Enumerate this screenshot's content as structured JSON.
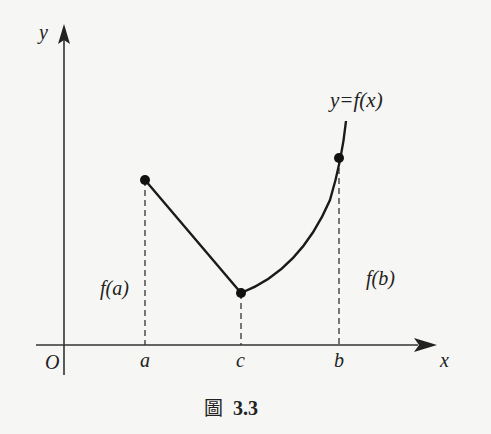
{
  "figure": {
    "caption_prefix": "圖",
    "caption_number": "3.3"
  },
  "axes": {
    "x_label": "x",
    "y_label": "y",
    "origin_label": "O"
  },
  "ticks": {
    "a": "a",
    "c": "c",
    "b": "b"
  },
  "labels": {
    "function": "y=f(x)",
    "f_a": "f(a)",
    "f_b": "f(b)"
  },
  "colors": {
    "ink": "#222222",
    "background": "#f6f6f4"
  },
  "points": [
    {
      "name": "A",
      "x": "a",
      "y": "f(a)"
    },
    {
      "name": "C",
      "x": "c",
      "y": "f(c)"
    },
    {
      "name": "B",
      "x": "b",
      "y": "f(b)"
    }
  ]
}
